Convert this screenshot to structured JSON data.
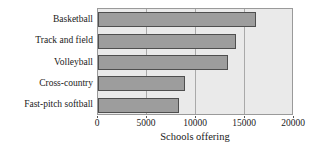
{
  "chart_data": {
    "type": "bar",
    "orientation": "horizontal",
    "title": "",
    "subtitle": "",
    "xlabel": "Schools offering",
    "ylabel": "",
    "categories": [
      "Basketball",
      "Track and field",
      "Volleyball",
      "Cross-country",
      "Fast-pitch softball"
    ],
    "values": [
      16100,
      14100,
      13300,
      8900,
      8300
    ],
    "xlim": [
      0,
      20000
    ],
    "xticks": [
      0,
      5000,
      10000,
      15000,
      20000
    ],
    "xtick_labels": [
      "0",
      "5000",
      "10000",
      "15000",
      "20000"
    ],
    "grid": true,
    "grid_axis": "x",
    "legend": false,
    "legend_position": "none",
    "series": [
      {
        "name": "Schools offering",
        "values": [
          16100,
          14100,
          13300,
          8900,
          8300
        ]
      }
    ]
  },
  "style": {
    "bar_fill": "#9d9d9d",
    "bar_edge": "#4f4f4f",
    "plot_background": "#eaeaea",
    "plot_border": "#9a9a9a",
    "gridline_color": "#a9a9a9",
    "page_background": "#ffffff",
    "text_color": "#1a1a1a"
  }
}
